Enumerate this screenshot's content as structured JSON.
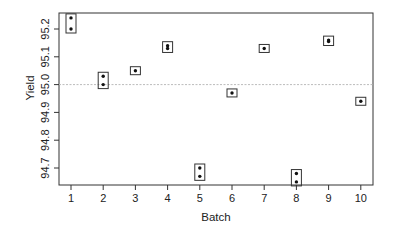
{
  "chart_data": {
    "type": "scatter",
    "title": "",
    "xlabel": "Batch",
    "ylabel": "Yield",
    "x_ticks": [
      "1",
      "2",
      "3",
      "4",
      "5",
      "6",
      "7",
      "8",
      "9",
      "10"
    ],
    "y_ticks": [
      "94.7",
      "94.8",
      "94.9",
      "95.0",
      "95.1",
      "95.2"
    ],
    "xlim": [
      0.6,
      10.4
    ],
    "ylim": [
      94.61,
      95.26
    ],
    "grid": false,
    "reference_line": {
      "y": 95.0,
      "style": "dotted",
      "color": "#bbbbbb"
    },
    "series": [
      {
        "name": "Yield by batch (points boxed per batch)",
        "points": [
          {
            "batch": 1,
            "values": [
              95.24,
              95.2
            ]
          },
          {
            "batch": 2,
            "values": [
              95.03,
              95.0
            ]
          },
          {
            "batch": 3,
            "values": [
              95.05
            ]
          },
          {
            "batch": 4,
            "values": [
              95.14,
              95.13
            ]
          },
          {
            "batch": 5,
            "values": [
              94.7,
              94.67
            ]
          },
          {
            "batch": 6,
            "values": [
              94.97
            ]
          },
          {
            "batch": 7,
            "values": [
              95.13
            ]
          },
          {
            "batch": 8,
            "values": [
              94.68,
              94.65
            ]
          },
          {
            "batch": 9,
            "values": [
              95.16,
              95.155
            ]
          },
          {
            "batch": 10,
            "values": [
              94.94
            ]
          }
        ]
      }
    ]
  },
  "style": {
    "axis_color": "#333333",
    "point_color": "#111111",
    "box_color": "#333333",
    "ref_line_color": "#bbbbbb"
  }
}
